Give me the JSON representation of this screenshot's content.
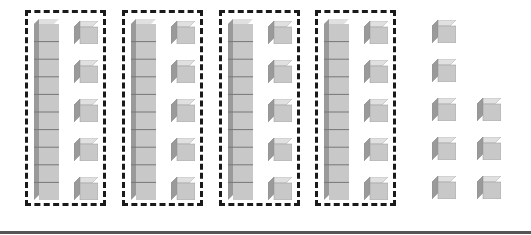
{
  "diagram": {
    "type": "base-ten-blocks",
    "groups": [
      {
        "tens": 1,
        "ones": 5
      },
      {
        "tens": 1,
        "ones": 5
      },
      {
        "tens": 1,
        "ones": 5
      },
      {
        "tens": 1,
        "ones": 5
      }
    ],
    "loose_ones": 8,
    "loose_columns": [
      5,
      3
    ],
    "colors": {
      "cube_front": "#c8c8c8",
      "cube_top": "#e0e0e0",
      "cube_side": "#9a9a9a",
      "border": "#1a1a1a",
      "baseline": "#555555"
    }
  }
}
